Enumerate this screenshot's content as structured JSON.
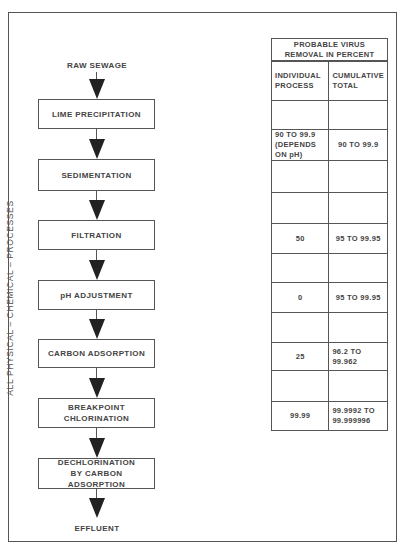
{
  "diagram": {
    "side_label": "ALL PHYSICAL  –  CHEMICAL  –  PROCESSES",
    "input": "RAW SEWAGE",
    "output": "EFFLUENT",
    "steps": [
      {
        "label": "LIME PRECIPITATION"
      },
      {
        "label": "SEDIMENTATION"
      },
      {
        "label": "FILTRATION"
      },
      {
        "label": "pH ADJUSTMENT"
      },
      {
        "label": "CARBON ADSORPTION"
      },
      {
        "label": "BREAKPOINT CHLORINATION"
      },
      {
        "label": "DECHLORINATION BY CARBON ADSORPTION"
      }
    ]
  },
  "table": {
    "title": "PROBABLE VIRUS REMOVAL IN PERCENT",
    "headers": [
      "INDIVIDUAL PROCESS",
      "CUMULATIVE TOTAL"
    ],
    "rows": [
      {
        "individual": "",
        "cumulative": ""
      },
      {
        "individual": "90  TO 99.9 (DEPENDS ON pH)",
        "cumulative": "90 TO 99.9"
      },
      {
        "individual": "",
        "cumulative": ""
      },
      {
        "individual": "",
        "cumulative": ""
      },
      {
        "individual": "50",
        "cumulative": "95 TO 99.95"
      },
      {
        "individual": "",
        "cumulative": ""
      },
      {
        "individual": "0",
        "cumulative": "95 TO 99.95"
      },
      {
        "individual": "",
        "cumulative": ""
      },
      {
        "individual": "25",
        "cumulative": "96.2 TO 99.962"
      },
      {
        "individual": "",
        "cumulative": ""
      },
      {
        "individual": "99.99",
        "cumulative": "99.9992 TO 99.999996"
      }
    ]
  }
}
